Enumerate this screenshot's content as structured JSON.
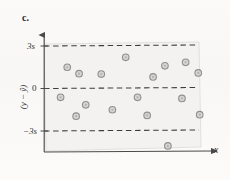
{
  "figure": {
    "panel_label": "c.",
    "type": "residual-scatter-plot",
    "background_color": "#f3f2f0",
    "marker_fill_color": "#bdbdbd",
    "marker_stroke_color": "#8f8f8f",
    "axis_color": "#4a4a4a",
    "dashed_line_color": "#3d3d3d"
  },
  "axes": {
    "x_label": "x",
    "y_label": "(y − ŷ)",
    "y_ticks": [
      {
        "label": "3s",
        "value": 3
      },
      {
        "label": "0",
        "value": 0
      },
      {
        "label": "−3s",
        "value": -3
      }
    ]
  },
  "reference_lines": [
    {
      "name": "upper-3s-line",
      "label": "3s",
      "value": 3,
      "style": "dashed"
    },
    {
      "name": "zero-line",
      "label": "0",
      "value": 0,
      "style": "dashed"
    },
    {
      "name": "lower-3s-line",
      "label": "−3s",
      "value": -3,
      "style": "dashed"
    }
  ],
  "chart_data": {
    "type": "scatter",
    "title": "c.",
    "xlabel": "x",
    "ylabel": "(y − ŷ)",
    "xlim": [
      0,
      10
    ],
    "ylim": [
      -4.6,
      3.4
    ],
    "grid": false,
    "legend": null,
    "reference_lines_y": [
      3,
      0,
      -3
    ],
    "annotations": [
      {
        "text": "outlier below −3s",
        "x": 8.1,
        "y": -4.05
      }
    ],
    "series": [
      {
        "name": "residuals",
        "marker": "circle",
        "points": [
          {
            "x": 1.3,
            "y": 1.5
          },
          {
            "x": 2.1,
            "y": 1.05
          },
          {
            "x": 3.6,
            "y": 1.02
          },
          {
            "x": 5.25,
            "y": 2.2
          },
          {
            "x": 7.1,
            "y": 0.82
          },
          {
            "x": 7.9,
            "y": 1.6
          },
          {
            "x": 9.3,
            "y": 1.85
          },
          {
            "x": 10.15,
            "y": 1.1
          },
          {
            "x": 0.85,
            "y": -0.62
          },
          {
            "x": 2.55,
            "y": -1.15
          },
          {
            "x": 1.9,
            "y": -1.95
          },
          {
            "x": 4.35,
            "y": -1.5
          },
          {
            "x": 6.05,
            "y": -0.62
          },
          {
            "x": 6.7,
            "y": -1.9
          },
          {
            "x": 9.05,
            "y": -0.7
          },
          {
            "x": 10.25,
            "y": -1.85
          },
          {
            "x": 8.1,
            "y": -4.05
          }
        ]
      }
    ]
  }
}
